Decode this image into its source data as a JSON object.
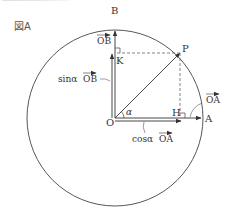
{
  "figure": {
    "title": "図A",
    "points": {
      "O": "O",
      "A": "A",
      "B": "B",
      "P": "P",
      "H": "H",
      "K": "K"
    },
    "angle_label": "α",
    "vector_labels": {
      "OA": "OA",
      "OB": "OB",
      "cos_prefix": "cosα",
      "cos_vec": "OA",
      "sin_prefix": "sinα",
      "sin_vec": "OB"
    },
    "colors": {
      "line": "#333333",
      "dashed": "#666666",
      "background": "#ffffff"
    }
  }
}
